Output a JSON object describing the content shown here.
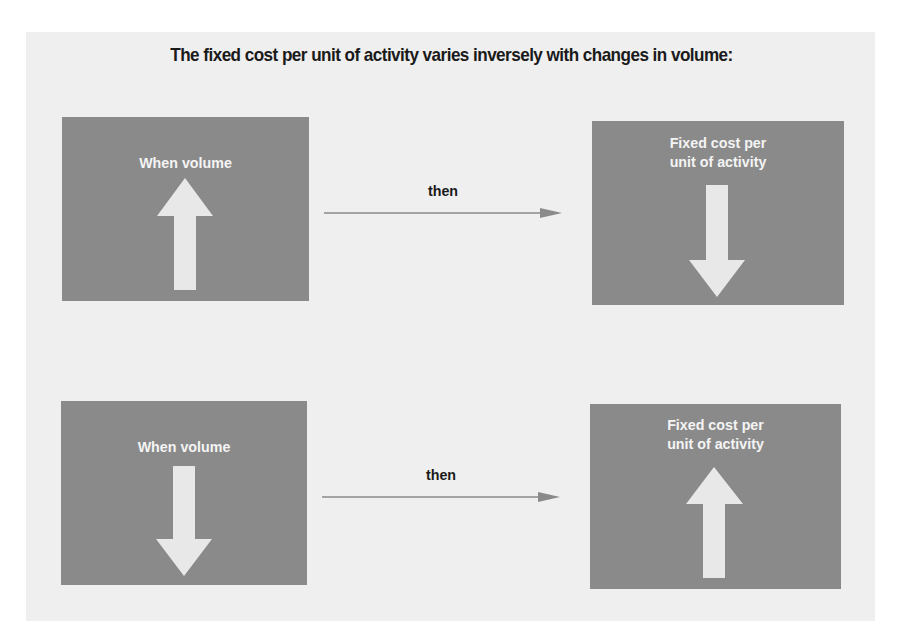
{
  "title": "The fixed cost per unit of activity varies inversely with changes in volume:",
  "colors": {
    "panel": "#efefef",
    "box": "#8a8a8a",
    "arrow_fill": "#e8e8e8",
    "connector": "#8a8a8a",
    "text_dark": "#1a1a1a",
    "text_light": "#f4f4f4"
  },
  "rows": [
    {
      "left": {
        "label": "When volume",
        "arrow": "up-arrow-icon"
      },
      "connector": {
        "label": "then"
      },
      "right": {
        "label_line1": "Fixed cost per",
        "label_line2": "unit of activity",
        "arrow": "down-arrow-icon"
      }
    },
    {
      "left": {
        "label": "When volume",
        "arrow": "down-arrow-icon"
      },
      "connector": {
        "label": "then"
      },
      "right": {
        "label_line1": "Fixed cost per",
        "label_line2": "unit of activity",
        "arrow": "up-arrow-icon"
      }
    }
  ]
}
